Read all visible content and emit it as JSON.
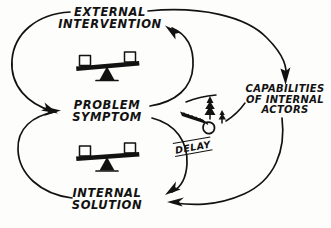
{
  "diagram": {
    "type": "causal-loop-diagram",
    "background_color": "#fdfdfb",
    "ink_color": "#121212"
  },
  "nodes": [
    {
      "id": "external-intervention",
      "line1": "EXTERNAL",
      "line2": "INTERVENTION"
    },
    {
      "id": "problem-symptom",
      "line1": "PROBLEM",
      "line2": "SYMPTOM"
    },
    {
      "id": "internal-solution",
      "line1": "INTERNAL",
      "line2": "SOLUTION"
    },
    {
      "id": "capabilities-of-internal-actors",
      "line1": "CAPABILITIES",
      "line2": "OF INTERNAL",
      "line3": "ACTORS"
    }
  ],
  "annotations": {
    "delay_label": "DELAY"
  },
  "icons": [
    {
      "id": "balance-scale-upper",
      "name": "balance-scale-icon"
    },
    {
      "id": "balance-scale-lower",
      "name": "balance-scale-icon"
    },
    {
      "id": "saw-and-trees",
      "name": "saw-and-trees-icon"
    }
  ],
  "links": [
    {
      "id": "external-to-problem",
      "from": "external-intervention",
      "to": "problem-symptom"
    },
    {
      "id": "problem-to-external",
      "from": "problem-symptom",
      "to": "external-intervention"
    },
    {
      "id": "external-to-capabilities",
      "from": "external-intervention",
      "to": "capabilities-of-internal-actors"
    },
    {
      "id": "capabilities-to-internal",
      "from": "capabilities-of-internal-actors",
      "to": "internal-solution"
    },
    {
      "id": "problem-to-internal-delayed",
      "from": "problem-symptom",
      "to": "internal-solution",
      "delay": true
    },
    {
      "id": "internal-to-problem",
      "from": "internal-solution",
      "to": "problem-symptom"
    }
  ]
}
